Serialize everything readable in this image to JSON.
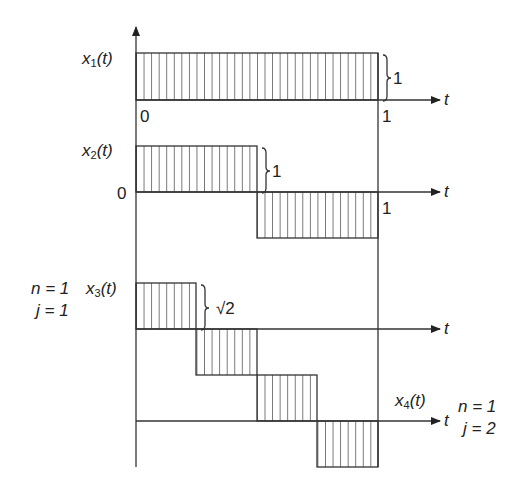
{
  "diagram": {
    "type": "haar-function-waveforms",
    "axis_label": "t",
    "colors": {
      "line": "#333333",
      "background": "#ffffff"
    },
    "signals": [
      {
        "id": "x1",
        "name": "x",
        "sub": "1",
        "arg": "(t)",
        "amplitude_label": "1",
        "origin_label": "0",
        "end_label": "1",
        "segments": [
          {
            "from": 0,
            "to": 1,
            "value": 1
          }
        ]
      },
      {
        "id": "x2",
        "name": "x",
        "sub": "2",
        "arg": "(t)",
        "amplitude_label": "1",
        "origin_label": "0",
        "end_label": "1",
        "segments": [
          {
            "from": 0,
            "to": 0.5,
            "value": 1
          },
          {
            "from": 0.5,
            "to": 1,
            "value": -1
          }
        ]
      },
      {
        "id": "x3",
        "name": "x",
        "sub": "3",
        "arg": "(t)",
        "amplitude_label": "√2",
        "params": {
          "n": "n = 1",
          "j": "j = 1"
        },
        "segments": [
          {
            "from": 0,
            "to": 0.25,
            "value": 1.414
          },
          {
            "from": 0.25,
            "to": 0.5,
            "value": -1.414
          },
          {
            "from": 0.5,
            "to": 1,
            "value": 0
          }
        ]
      },
      {
        "id": "x4",
        "name": "x",
        "sub": "4",
        "arg": "(t)",
        "params": {
          "n": "n = 1",
          "j": "j = 2"
        },
        "segments": [
          {
            "from": 0,
            "to": 0.5,
            "value": 0
          },
          {
            "from": 0.5,
            "to": 0.75,
            "value": 1.414
          },
          {
            "from": 0.75,
            "to": 1,
            "value": -1.414
          }
        ]
      }
    ]
  }
}
